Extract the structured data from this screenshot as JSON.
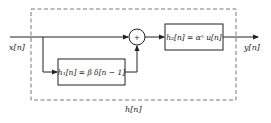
{
  "diagram": {
    "type": "block-diagram",
    "input_label": "x[n]",
    "output_label": "y[n]",
    "system_label": "h[n]",
    "blocks": [
      {
        "id": "h1",
        "label": "h₁[n] = β δ[n − 1]"
      },
      {
        "id": "h2",
        "label": "h₂[n] = αⁿ u[n]"
      }
    ],
    "summer_symbol": "+",
    "colors": {
      "line": "#222222",
      "dashed": "#555555",
      "background": "#ffffff"
    }
  }
}
